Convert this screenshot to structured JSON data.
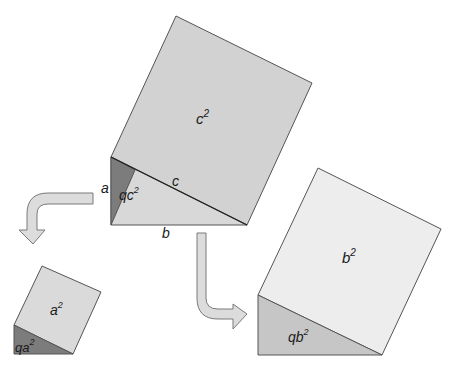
{
  "diagram": {
    "title": "",
    "colors": {
      "c_square": "#d2d2d2",
      "c_triangle": "#d8d8d8",
      "c_dark_triangle": "#7c7c7c",
      "a_square": "#dadada",
      "a_triangle": "#7c7c7c",
      "b_square": "#ededed",
      "b_triangle": "#c6c6c6",
      "arrow_fill": "#dcdcdc",
      "stroke": "#555555"
    },
    "labels": {
      "c_squared": "c",
      "c_squared_exp": "2",
      "side_a": "a",
      "side_b": "b",
      "side_c": "c",
      "qc_squared_q": "q",
      "qc_squared_base": "c",
      "qc_squared_exp": "2",
      "a_squared": "a",
      "a_squared_exp": "2",
      "qa_squared_base": "qa",
      "qa_squared_exp": "2",
      "b_squared": "b",
      "b_squared_exp": "2",
      "qb_squared_base": "qb",
      "qb_squared_exp": "2"
    },
    "shapes": [
      {
        "name": "c-square",
        "points": "111,157 176,16 312,83 247,225"
      },
      {
        "name": "c-triangle",
        "points": "111,157 247,225 111,225"
      },
      {
        "name": "c-dark-triangle",
        "points": "111,157 135,170 111,225"
      },
      {
        "name": "a-square",
        "points": "14,325 42,266 101,292 73,354"
      },
      {
        "name": "a-triangle",
        "points": "14,325 73,354 14,354"
      },
      {
        "name": "b-square",
        "points": "258,295 318,168 441,229 382,355"
      },
      {
        "name": "b-triangle",
        "points": "258,295 382,355 258,355"
      }
    ],
    "arrows": [
      {
        "name": "arrow-to-a-square",
        "direction": "down"
      },
      {
        "name": "arrow-to-b-square",
        "direction": "right"
      }
    ]
  }
}
